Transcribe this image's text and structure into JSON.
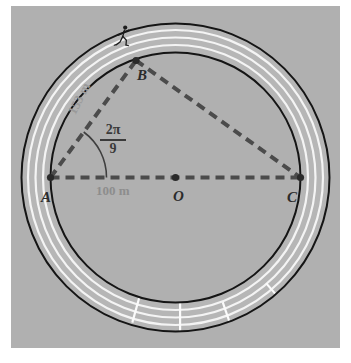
{
  "figure": {
    "panel_background": "#b0b0b0",
    "points": {
      "A": {
        "label": "A",
        "role": "left-point-on-inner-circle"
      },
      "B": {
        "label": "B",
        "role": "runner-position-on-inner-circle"
      },
      "C": {
        "label": "C",
        "role": "right-point-on-inner-circle"
      },
      "O": {
        "label": "O",
        "role": "circle-center"
      }
    },
    "measurements": {
      "chord_AB": "153 m",
      "diameter_AC": "100 m",
      "angle_at_A": {
        "numerator": "2π",
        "denominator": "9"
      }
    },
    "icons": {
      "runner": "runner-icon"
    },
    "colors": {
      "track_outline": "#1a1a1a",
      "lane_line": "#f2f2f2",
      "dashed_line": "#4a4a4a",
      "dimension_text": "#8d8d8d",
      "point_text": "#2b2b2b",
      "angle_text": "#3a3a3a"
    },
    "track": {
      "lanes": 4,
      "outer_radius_px": 154,
      "inner_radius_px": 125,
      "stagger_marks": 4
    }
  }
}
